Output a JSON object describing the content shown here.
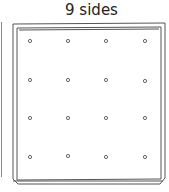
{
  "title": "9 sides",
  "board": {
    "type": "geoboard",
    "rows": 4,
    "columns": 4,
    "peg_count": 16,
    "stroke_color": "#555555"
  }
}
